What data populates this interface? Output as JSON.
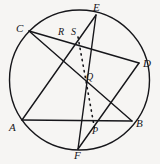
{
  "figure": {
    "name": "circle-with-inscribed-hexagon-and-chords",
    "background_color": "#f6f5f3",
    "stroke_color": "#16161a",
    "canvas": {
      "width": 160,
      "height": 164
    }
  },
  "circle": {
    "center_x": 79.5,
    "center_y": 80,
    "radius": 70,
    "stroke_width": 1.4
  },
  "points": [
    {
      "id": "C",
      "label": "C",
      "x": 29,
      "y": 31,
      "label_x": 16,
      "label_y": 23,
      "on_circle": true
    },
    {
      "id": "E",
      "label": "E",
      "x": 96,
      "y": 15,
      "label_x": 93,
      "label_y": 2,
      "on_circle": true
    },
    {
      "id": "D",
      "label": "D",
      "x": 139,
      "y": 63,
      "label_x": 143,
      "label_y": 58,
      "on_circle": true
    },
    {
      "id": "B",
      "label": "B",
      "x": 132,
      "y": 121,
      "label_x": 136,
      "label_y": 118,
      "on_circle": true
    },
    {
      "id": "F",
      "label": "F",
      "x": 78,
      "y": 149,
      "label_x": 74,
      "label_y": 150,
      "on_circle": true
    },
    {
      "id": "A",
      "label": "A",
      "x": 22,
      "y": 120,
      "label_x": 9,
      "label_y": 122,
      "on_circle": true
    },
    {
      "id": "R",
      "label": "R",
      "x": 66,
      "y": 36,
      "label_x": 58,
      "label_y": 27,
      "on_circle": false
    },
    {
      "id": "S",
      "label": "S",
      "x": 78,
      "y": 37,
      "label_x": 71,
      "label_y": 27,
      "on_circle": false
    },
    {
      "id": "Q",
      "label": "Q",
      "x": 86,
      "y": 81,
      "label_x": 86,
      "label_y": 72,
      "on_circle": false
    },
    {
      "id": "P",
      "label": "P",
      "x": 95,
      "y": 131,
      "label_x": 92,
      "label_y": 126,
      "on_circle": false
    }
  ],
  "chords": [
    {
      "id": "CD",
      "from": "C",
      "to": "D",
      "label": "chord-C-D"
    },
    {
      "id": "CB",
      "from": "C",
      "to": "B",
      "label": "chord-C-B"
    },
    {
      "id": "EF",
      "from": "E",
      "to": "F",
      "label": "chord-E-F"
    },
    {
      "id": "EA",
      "from": "E",
      "to": "A",
      "label": "chord-E-A"
    },
    {
      "id": "AB",
      "from": "A",
      "to": "B",
      "label": "chord-A-B"
    },
    {
      "id": "DF",
      "from": "D",
      "to": "F",
      "label": "chord-D-F"
    }
  ],
  "dotted_line": {
    "id": "SP",
    "label": "dotted-line-S-through-Q-to-P",
    "from": "S",
    "through": "Q",
    "to": "P",
    "dash_pattern": "1.2 4.5",
    "stroke_width": 1.6
  }
}
